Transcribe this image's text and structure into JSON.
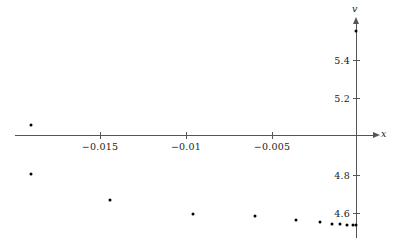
{
  "chart_data": {
    "type": "scatter",
    "title": "",
    "xlabel": "x",
    "ylabel": "v",
    "grid": false,
    "legend": null,
    "xlim": [
      -0.0205,
      0.0011
    ],
    "ylim": [
      4.53,
      5.58
    ],
    "x_ticks": [
      {
        "value": -0.015,
        "label": "−0.015",
        "px": 100
      },
      {
        "value": -0.01,
        "label": "−0.01",
        "px": 186
      },
      {
        "value": -0.005,
        "label": "−0.005",
        "px": 272
      }
    ],
    "y_ticks": [
      {
        "value": 5.4,
        "label": "5.4",
        "px": 60
      },
      {
        "value": 5.2,
        "label": "5.2",
        "px": 98
      },
      {
        "value": 4.8,
        "label": "4.8",
        "px": 175
      },
      {
        "value": 4.6,
        "label": "4.6",
        "px": 213
      }
    ],
    "axis_origin_px": {
      "x": 356,
      "y": 135
    },
    "axis_value_at_origin": {
      "x": 0.0,
      "v": 5.0
    },
    "points": [
      {
        "x": -0.019,
        "v": 5.05,
        "px": 31,
        "py": 125
      },
      {
        "x": -0.019,
        "v": 4.8,
        "px": 31,
        "py": 174
      },
      {
        "x": -0.0144,
        "v": 4.67,
        "px": 110,
        "py": 200
      },
      {
        "x": -0.0096,
        "v": 4.6,
        "px": 193,
        "py": 214
      },
      {
        "x": -0.006,
        "v": 4.59,
        "px": 255,
        "py": 216
      },
      {
        "x": -0.0036,
        "v": 4.57,
        "px": 296,
        "py": 220
      },
      {
        "x": -0.0021,
        "v": 4.56,
        "px": 320,
        "py": 222
      },
      {
        "x": -0.0014,
        "v": 4.55,
        "px": 332,
        "py": 224
      },
      {
        "x": -0.0009,
        "v": 4.55,
        "px": 340,
        "py": 224
      },
      {
        "x": -0.0005,
        "v": 4.55,
        "px": 347,
        "py": 225
      },
      {
        "x": -0.0002,
        "v": 4.55,
        "px": 353,
        "py": 225
      },
      {
        "x": 0.0,
        "v": 4.55,
        "px": 356,
        "py": 225
      },
      {
        "x": 0.0,
        "v": 5.54,
        "px": 356,
        "py": 31
      }
    ],
    "series": [
      {
        "name": "",
        "x": [
          -0.019,
          -0.019,
          -0.0144,
          -0.0096,
          -0.006,
          -0.0036,
          -0.0021,
          -0.0014,
          -0.0009,
          -0.0005,
          -0.0002,
          0.0,
          0.0
        ],
        "values": [
          5.05,
          4.8,
          4.67,
          4.6,
          4.59,
          4.57,
          4.56,
          4.55,
          4.55,
          4.55,
          4.55,
          4.55,
          5.54
        ]
      }
    ],
    "colors": {
      "point": "#000000",
      "axis": "#555555",
      "text": "#1a1a1a",
      "background": "#ffffff"
    }
  }
}
